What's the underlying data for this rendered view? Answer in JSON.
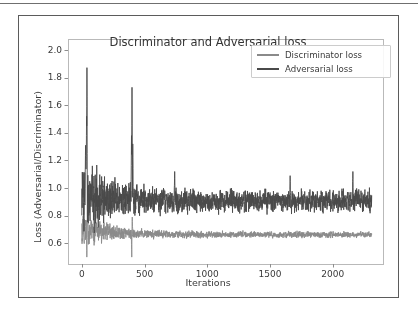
{
  "page": {
    "background_color": "#ffffff",
    "figure_border_color": "#5b5b5b",
    "top_rule_color": "#6f6f6f"
  },
  "chart_data": {
    "type": "line",
    "title": "Discriminator and Adversarial loss",
    "xlabel": "Iterations",
    "ylabel": "Loss (Adversarial/Discriminator)",
    "xlim": [
      -110,
      2400
    ],
    "ylim": [
      0.45,
      2.08
    ],
    "xticks": [
      0,
      500,
      1000,
      1500,
      2000
    ],
    "xtick_labels": [
      "0",
      "500",
      "1000",
      "1500",
      "2000"
    ],
    "yticks": [
      0.6,
      0.8,
      1.0,
      1.2,
      1.4,
      1.6,
      1.8,
      2.0
    ],
    "ytick_labels": [
      "0.6",
      "0.8",
      "1.0",
      "1.2",
      "1.4",
      "1.6",
      "1.8",
      "2.0"
    ],
    "grid": false,
    "legend_position": "upper right",
    "x_start": 0,
    "x_end": 2310,
    "n_points": 2311,
    "series": [
      {
        "name": "Discriminator loss",
        "color": "#8a8a8a",
        "linewidth": 0.9,
        "baseline_start": 0.7,
        "baseline_end": 0.662,
        "baseline_decay_iters": 260,
        "noise_start": 0.085,
        "noise_end": 0.016,
        "noise_decay_iters": 240,
        "spikes": [
          {
            "x": 40,
            "y": 0.5,
            "width": 3
          },
          {
            "x": 47,
            "y": 0.84,
            "width": 3
          },
          {
            "x": 398,
            "y": 0.5,
            "width": 2
          },
          {
            "x": 402,
            "y": 0.79,
            "width": 3
          }
        ],
        "approx_mean_tail": 0.665,
        "approx_range_tail": [
          0.63,
          0.71
        ]
      },
      {
        "name": "Adversarial loss",
        "color": "#4a4a4a",
        "linewidth": 0.9,
        "baseline_start": 0.95,
        "baseline_end": 0.905,
        "baseline_decay_iters": 300,
        "noise_start": 0.175,
        "noise_end": 0.055,
        "noise_decay_iters": 280,
        "spikes": [
          {
            "x": 41,
            "y": 1.99,
            "width": 2
          },
          {
            "x": 38,
            "y": 1.52,
            "width": 3
          },
          {
            "x": 30,
            "y": 1.31,
            "width": 4
          },
          {
            "x": 400,
            "y": 1.73,
            "width": 2
          },
          {
            "x": 396,
            "y": 1.38,
            "width": 3
          },
          {
            "x": 406,
            "y": 1.32,
            "width": 3
          },
          {
            "x": 740,
            "y": 1.12,
            "width": 3
          },
          {
            "x": 1660,
            "y": 1.09,
            "width": 3
          },
          {
            "x": 2160,
            "y": 1.12,
            "width": 3
          }
        ],
        "approx_mean_tail": 0.905,
        "approx_range_tail": [
          0.8,
          1.02
        ]
      }
    ]
  },
  "legend": {
    "items": [
      {
        "label": "Discriminator loss",
        "color": "#8a8a8a"
      },
      {
        "label": "Adversarial loss",
        "color": "#4a4a4a"
      }
    ]
  }
}
